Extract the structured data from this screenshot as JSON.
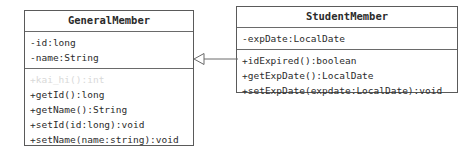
{
  "diagram": {
    "type": "uml-class-diagram",
    "background_color": "#ffffff",
    "border_color": "#5a5a5a",
    "text_color": "#2b2b2b",
    "disabled_text_color": "#d9d9d9",
    "classes": [
      {
        "name": "GeneralMember",
        "attributes": [
          {
            "text": "-id:long",
            "disabled": false
          },
          {
            "text": "-name:String",
            "disabled": false
          }
        ],
        "methods": [
          {
            "text": "+kai_hi():int",
            "disabled": true
          },
          {
            "text": "+getId():long",
            "disabled": false
          },
          {
            "text": "+getName():String",
            "disabled": false
          },
          {
            "text": "+setId(id:long):void",
            "disabled": false
          },
          {
            "text": "+setName(name:string):void",
            "disabled": false
          }
        ]
      },
      {
        "name": "StudentMember",
        "attributes": [
          {
            "text": "-expDate:LocalDate",
            "disabled": false
          }
        ],
        "methods": [
          {
            "text": "+idExpired():boolean",
            "disabled": false
          },
          {
            "text": "+getExpDate():LocalDate",
            "disabled": false
          },
          {
            "text": "+setExpDate(expdate:LocalDate):void",
            "disabled": false
          }
        ]
      }
    ],
    "relationships": [
      {
        "kind": "generalization",
        "label": "",
        "source": "StudentMember",
        "target": "GeneralMember",
        "arrow": "hollow-triangle"
      }
    ]
  }
}
